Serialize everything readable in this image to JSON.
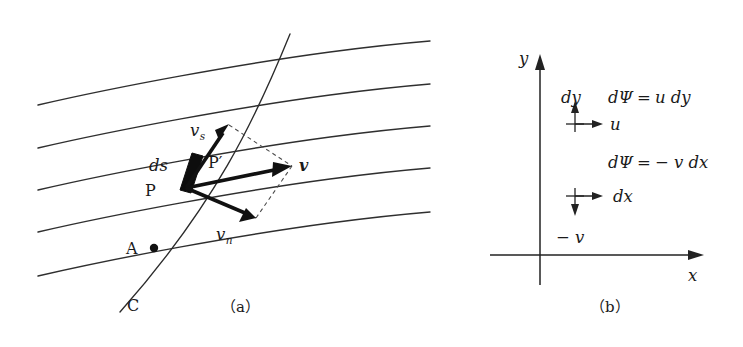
{
  "figure": {
    "panels": [
      {
        "id": "a",
        "caption": "（a）",
        "description": "streamlines with curve C crossing them, velocity decomposition at point P",
        "labels": {
          "v_vector": "v",
          "v_s": "v",
          "v_s_sub": "s",
          "v_n": "v",
          "v_n_sub": "n",
          "ds": "ds",
          "point_P": "P",
          "point_Pprime": "P′",
          "point_A": "A",
          "curve_C": "C"
        }
      },
      {
        "id": "b",
        "caption": "（b）",
        "description": "Cartesian axes with differential stream function contributions",
        "labels": {
          "axis_x": "x",
          "axis_y": "y",
          "dy": "dy",
          "u": "u",
          "eq_top": "dΨ = u dy",
          "eq_bottom": "dΨ = − v dx",
          "dx": "dx",
          "minus_v": "− v"
        },
        "equations": {
          "top": {
            "lhs": "dΨ",
            "op": "=",
            "rhs": "u dy"
          },
          "bottom": {
            "lhs": "dΨ",
            "op": "=",
            "rhs": "− v dx"
          }
        }
      }
    ],
    "colors": {
      "ink": "#1a1a1a",
      "line": "#2f2f2f",
      "dashed": "#4a4a4a",
      "background": "#ffffff"
    }
  }
}
